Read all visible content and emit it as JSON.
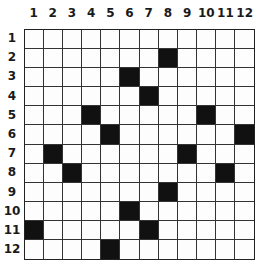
{
  "grid": {
    "rows": 12,
    "cols": 12,
    "column_labels": [
      "1",
      "2",
      "3",
      "4",
      "5",
      "6",
      "7",
      "8",
      "9",
      "10",
      "11",
      "12"
    ],
    "row_labels": [
      "1",
      "2",
      "3",
      "4",
      "5",
      "6",
      "7",
      "8",
      "9",
      "10",
      "11",
      "12"
    ],
    "filled_color": "#111111",
    "empty_color": "#fdfdfd",
    "filled_cells": [
      [
        2,
        8
      ],
      [
        3,
        6
      ],
      [
        4,
        7
      ],
      [
        5,
        4
      ],
      [
        5,
        10
      ],
      [
        6,
        5
      ],
      [
        6,
        12
      ],
      [
        7,
        2
      ],
      [
        7,
        9
      ],
      [
        8,
        3
      ],
      [
        8,
        11
      ],
      [
        9,
        8
      ],
      [
        10,
        6
      ],
      [
        11,
        1
      ],
      [
        11,
        7
      ],
      [
        12,
        5
      ]
    ]
  }
}
